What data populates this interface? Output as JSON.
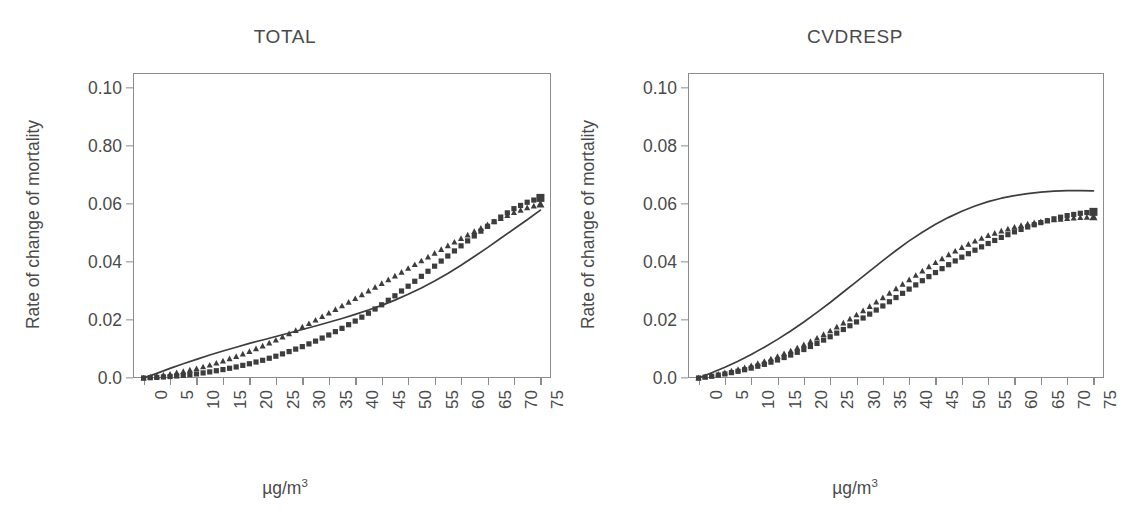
{
  "figure": {
    "background_color": "#ffffff",
    "line_color": "#3d3d3d",
    "marker_color": "#3d3d3d",
    "axis_color": "#8c8c8c",
    "text_color": "#4a4a4a"
  },
  "chart_data": [
    {
      "type": "line",
      "panel": "left",
      "title": "TOTAL",
      "xlabel": "µg/m³",
      "ylabel": "Rate of change of mortality",
      "xlim": [
        -2,
        77
      ],
      "ylim": [
        0.0,
        0.105
      ],
      "grid": false,
      "legend": "none",
      "xticks": [
        0,
        5,
        10,
        15,
        20,
        25,
        30,
        35,
        40,
        45,
        50,
        55,
        60,
        65,
        70,
        75
      ],
      "xtick_labels": [
        "0",
        "5",
        "10",
        "15",
        "20",
        "25",
        "30",
        "35",
        "40",
        "45",
        "50",
        "55",
        "60",
        "65",
        "70",
        "75"
      ],
      "xtick_rotation": 90,
      "yticks": [
        0.0,
        0.02,
        0.04,
        0.06,
        0.08,
        0.1
      ],
      "ytick_labels": [
        "0.0",
        "0.02",
        "0.04",
        "0.06",
        "0.80",
        "0.10"
      ],
      "x": [
        0,
        2.5,
        5,
        7.5,
        10,
        12.5,
        15,
        17.5,
        20,
        22.5,
        25,
        27.5,
        30,
        32.5,
        35,
        37.5,
        40,
        42.5,
        45,
        47.5,
        50,
        52.5,
        55,
        57.5,
        60,
        62.5,
        65,
        67.5,
        70,
        72.5,
        75
      ],
      "series": [
        {
          "name": "solid-curve",
          "style": "solid-line",
          "marker": "none",
          "values": [
            0.0,
            0.0016,
            0.0033,
            0.0049,
            0.0064,
            0.0079,
            0.0093,
            0.0106,
            0.0119,
            0.0131,
            0.0143,
            0.0155,
            0.0167,
            0.0179,
            0.0192,
            0.0205,
            0.0219,
            0.0234,
            0.025,
            0.0268,
            0.0288,
            0.031,
            0.0334,
            0.036,
            0.0388,
            0.0418,
            0.0449,
            0.0481,
            0.0513,
            0.0545,
            0.0578
          ]
        },
        {
          "name": "triangle-markers",
          "style": "markers",
          "marker": "triangle",
          "values": [
            0.0,
            0.0006,
            0.0013,
            0.0022,
            0.0032,
            0.0044,
            0.0058,
            0.0074,
            0.0091,
            0.011,
            0.013,
            0.0152,
            0.0175,
            0.0199,
            0.0223,
            0.0248,
            0.0273,
            0.0299,
            0.0325,
            0.0351,
            0.0377,
            0.0403,
            0.0429,
            0.0455,
            0.048,
            0.0504,
            0.0527,
            0.0549,
            0.0569,
            0.0586,
            0.0598
          ]
        },
        {
          "name": "square-markers",
          "style": "markers",
          "marker": "square",
          "values": [
            0.0,
            0.0002,
            0.0005,
            0.0009,
            0.0014,
            0.0021,
            0.0029,
            0.0038,
            0.0049,
            0.0061,
            0.0075,
            0.0091,
            0.0108,
            0.0127,
            0.0148,
            0.0171,
            0.0196,
            0.0223,
            0.0252,
            0.0283,
            0.0316,
            0.035,
            0.0385,
            0.042,
            0.0455,
            0.0489,
            0.0522,
            0.0554,
            0.0583,
            0.0605,
            0.062
          ]
        }
      ]
    },
    {
      "type": "line",
      "panel": "right",
      "title": "CVDRESP",
      "xlabel": "µg/m³",
      "ylabel": "Rate of change of mortality",
      "xlim": [
        -2,
        77
      ],
      "ylim": [
        0.0,
        0.105
      ],
      "grid": false,
      "legend": "none",
      "xticks": [
        0,
        5,
        10,
        15,
        20,
        25,
        30,
        35,
        40,
        45,
        50,
        55,
        60,
        65,
        70,
        75
      ],
      "xtick_labels": [
        "0",
        "5",
        "10",
        "15",
        "20",
        "25",
        "30",
        "35",
        "40",
        "45",
        "50",
        "55",
        "60",
        "65",
        "70",
        "75"
      ],
      "xtick_rotation": 90,
      "yticks": [
        0.0,
        0.02,
        0.04,
        0.06,
        0.08,
        0.1
      ],
      "ytick_labels": [
        "0.0",
        "0.02",
        "0.04",
        "0.06",
        "0.08",
        "0.10"
      ],
      "x": [
        0,
        2.5,
        5,
        7.5,
        10,
        12.5,
        15,
        17.5,
        20,
        22.5,
        25,
        27.5,
        30,
        32.5,
        35,
        37.5,
        40,
        42.5,
        45,
        47.5,
        50,
        52.5,
        55,
        57.5,
        60,
        62.5,
        65,
        67.5,
        70,
        72.5,
        75
      ],
      "series": [
        {
          "name": "solid-curve",
          "style": "solid-line",
          "marker": "none",
          "values": [
            0.0,
            0.0018,
            0.0037,
            0.0058,
            0.0081,
            0.0106,
            0.0133,
            0.0162,
            0.0193,
            0.0226,
            0.026,
            0.0296,
            0.0332,
            0.0368,
            0.0404,
            0.0439,
            0.0472,
            0.0502,
            0.0529,
            0.0553,
            0.0574,
            0.0592,
            0.0607,
            0.0619,
            0.0628,
            0.0635,
            0.064,
            0.0643,
            0.0645,
            0.0645,
            0.0644
          ]
        },
        {
          "name": "triangle-markers",
          "style": "markers",
          "marker": "triangle",
          "values": [
            0.0,
            0.0008,
            0.0018,
            0.0029,
            0.0042,
            0.0057,
            0.0074,
            0.0093,
            0.0114,
            0.0137,
            0.0162,
            0.0189,
            0.0217,
            0.0246,
            0.0276,
            0.0307,
            0.0338,
            0.0368,
            0.0397,
            0.0424,
            0.0449,
            0.0471,
            0.049,
            0.0506,
            0.0519,
            0.053,
            0.0538,
            0.0544,
            0.0549,
            0.0552,
            0.0554
          ]
        },
        {
          "name": "square-markers",
          "style": "markers",
          "marker": "square",
          "values": [
            0.0,
            0.0006,
            0.0014,
            0.0023,
            0.0034,
            0.0047,
            0.0062,
            0.0079,
            0.0098,
            0.0119,
            0.0142,
            0.0167,
            0.0193,
            0.022,
            0.0248,
            0.0277,
            0.0306,
            0.0335,
            0.0363,
            0.039,
            0.0416,
            0.044,
            0.0463,
            0.0484,
            0.0503,
            0.052,
            0.0535,
            0.0548,
            0.0559,
            0.0567,
            0.0572
          ]
        }
      ]
    }
  ]
}
